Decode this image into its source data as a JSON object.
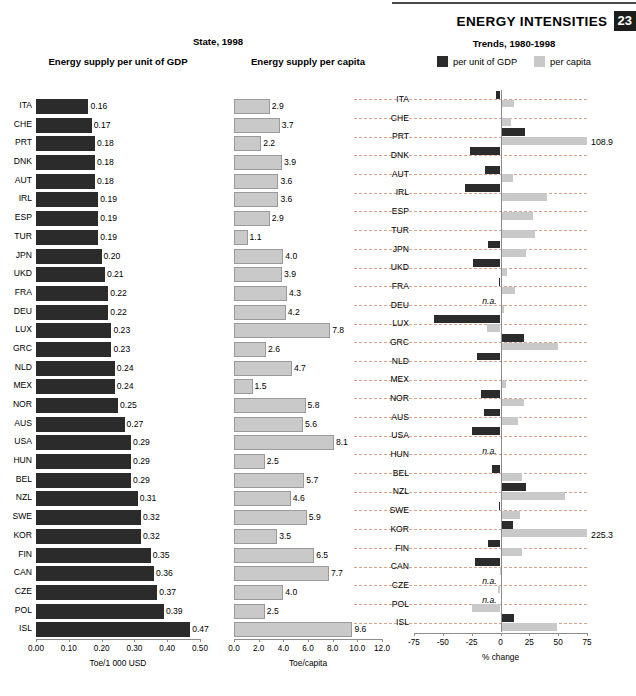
{
  "header": {
    "title": "ENERGY INTENSITIES",
    "page_number": "23"
  },
  "group_titles": {
    "state": "State, 1998",
    "trends": "Trends, 1980-1998"
  },
  "panels": {
    "gdp": {
      "title": "Energy supply per unit of GDP",
      "axis_caption": "Toe/1 000 USD",
      "ticks": [
        "0.00",
        "0.10",
        "0.20",
        "0.30",
        "0.40",
        "0.50"
      ]
    },
    "capita": {
      "title": "Energy supply per capita",
      "axis_caption": "Toe/capita",
      "ticks": [
        "0.0",
        "2.0",
        "4.0",
        "6.0",
        "8.0",
        "10.0",
        "12.0"
      ]
    },
    "trends": {
      "axis_caption": "% change",
      "ticks": [
        "-75",
        "-50",
        "-25",
        "0",
        "25",
        "50",
        "75"
      ],
      "legend": [
        {
          "label": "per unit of GDP",
          "color": "#2b2b2b"
        },
        {
          "label": "per capita",
          "color": "#c8c8c8"
        }
      ]
    }
  },
  "chart_data": [
    {
      "type": "bar",
      "orientation": "horizontal",
      "title": "Energy supply per unit of GDP",
      "group": "State, 1998",
      "xlabel": "Toe/1 000 USD",
      "ylabel": "",
      "xlim": [
        0.0,
        0.5
      ],
      "grid": false,
      "categories": [
        "ITA",
        "CHE",
        "PRT",
        "DNK",
        "AUT",
        "IRL",
        "ESP",
        "TUR",
        "JPN",
        "UKD",
        "FRA",
        "DEU",
        "LUX",
        "GRC",
        "NLD",
        "MEX",
        "NOR",
        "AUS",
        "USA",
        "HUN",
        "BEL",
        "NZL",
        "SWE",
        "KOR",
        "FIN",
        "CAN",
        "CZE",
        "POL",
        "ISL"
      ],
      "values": [
        0.16,
        0.17,
        0.18,
        0.18,
        0.18,
        0.19,
        0.19,
        0.19,
        0.2,
        0.21,
        0.22,
        0.22,
        0.23,
        0.23,
        0.24,
        0.24,
        0.25,
        0.27,
        0.29,
        0.29,
        0.29,
        0.31,
        0.32,
        0.32,
        0.35,
        0.36,
        0.37,
        0.39,
        0.47
      ],
      "value_labels": [
        "0.16",
        "0.17",
        "0.18",
        "0.18",
        "0.18",
        "0.19",
        "0.19",
        "0.19",
        "0.20",
        "0.21",
        "0.22",
        "0.22",
        "0.23",
        "0.23",
        "0.24",
        "0.24",
        "0.25",
        "0.27",
        "0.29",
        "0.29",
        "0.29",
        "0.31",
        "0.32",
        "0.32",
        "0.35",
        "0.36",
        "0.37",
        "0.39",
        "0.47"
      ],
      "series_color": "#2b2b2b"
    },
    {
      "type": "bar",
      "orientation": "horizontal",
      "title": "Energy supply per capita",
      "group": "State, 1998",
      "xlabel": "Toe/capita",
      "ylabel": "",
      "xlim": [
        0.0,
        12.0
      ],
      "grid": false,
      "categories": [
        "ITA",
        "CHE",
        "PRT",
        "DNK",
        "AUT",
        "IRL",
        "ESP",
        "TUR",
        "JPN",
        "UKD",
        "FRA",
        "DEU",
        "LUX",
        "GRC",
        "NLD",
        "MEX",
        "NOR",
        "AUS",
        "USA",
        "HUN",
        "BEL",
        "NZL",
        "SWE",
        "KOR",
        "FIN",
        "CAN",
        "CZE",
        "POL",
        "ISL"
      ],
      "values": [
        2.9,
        3.7,
        2.2,
        3.9,
        3.6,
        3.6,
        2.9,
        1.1,
        4.0,
        3.9,
        4.3,
        4.2,
        7.8,
        2.6,
        4.7,
        1.5,
        5.8,
        5.6,
        8.1,
        2.5,
        5.7,
        4.6,
        5.9,
        3.5,
        6.5,
        7.7,
        4.0,
        2.5,
        9.6
      ],
      "value_labels": [
        "2.9",
        "3.7",
        "2.2",
        "3.9",
        "3.6",
        "3.6",
        "2.9",
        "1.1",
        "4.0",
        "3.9",
        "4.3",
        "4.2",
        "7.8",
        "2.6",
        "4.7",
        "1.5",
        "5.8",
        "5.6",
        "8.1",
        "2.5",
        "5.7",
        "4.6",
        "5.9",
        "3.5",
        "6.5",
        "7.7",
        "4.0",
        "2.5",
        "9.6"
      ],
      "series_color": "#c9c9c9"
    },
    {
      "type": "bar",
      "orientation": "horizontal",
      "title": "Trends, 1980-1998",
      "group": "Trends, 1980-1998",
      "xlabel": "% change",
      "ylabel": "",
      "xlim": [
        -75,
        75
      ],
      "grid": true,
      "legend_position": "top",
      "categories": [
        "ITA",
        "CHE",
        "PRT",
        "DNK",
        "AUT",
        "IRL",
        "ESP",
        "TUR",
        "JPN",
        "UKD",
        "FRA",
        "DEU",
        "LUX",
        "GRC",
        "NLD",
        "MEX",
        "NOR",
        "AUS",
        "USA",
        "HUN",
        "BEL",
        "NZL",
        "SWE",
        "KOR",
        "FIN",
        "CAN",
        "CZE",
        "POL",
        "ISL"
      ],
      "series": [
        {
          "name": "per unit of GDP",
          "color": "#2b2b2b",
          "values": [
            -3.5,
            0,
            21.5,
            -26.5,
            -13.5,
            -31,
            1.5,
            0.5,
            -11,
            -23.5,
            -1.5,
            null,
            -58,
            20,
            -20.5,
            1,
            -16.5,
            -14.5,
            -24.5,
            null,
            -7,
            22,
            -1.5,
            11,
            -10.5,
            -22,
            null,
            null,
            11.5
          ]
        },
        {
          "name": "per capita",
          "color": "#c9c9c9",
          "values": [
            11.5,
            9,
            108.9,
            0.5,
            11,
            40,
            28,
            30,
            22,
            6,
            12.5,
            3,
            -12,
            50,
            1.5,
            4.5,
            20,
            15.5,
            0.5,
            0,
            19,
            55.5,
            17,
            225.3,
            19,
            -0.5,
            -2.5,
            -25,
            49
          ]
        }
      ],
      "overflow_labels": [
        {
          "category": "PRT",
          "series": "per capita",
          "label": "108.9"
        },
        {
          "category": "KOR",
          "series": "per capita",
          "label": "225.3"
        }
      ],
      "na_labels": [
        {
          "category": "DEU",
          "label": "n.a."
        },
        {
          "category": "HUN",
          "label": "n.a."
        },
        {
          "category": "CZE",
          "label": "n.a."
        },
        {
          "category": "POL",
          "label": "n.a."
        }
      ]
    }
  ]
}
